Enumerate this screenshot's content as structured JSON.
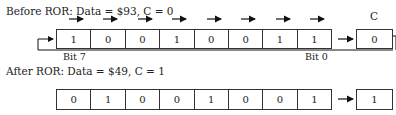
{
  "before": {
    "label": "Before ROR: Data = $93, C = 0",
    "bits": [
      "1",
      "0",
      "0",
      "1",
      "0",
      "0",
      "1",
      "1"
    ],
    "carry": "0"
  },
  "after": {
    "label": "After ROR: Data = $49, C = 1",
    "bits": [
      "0",
      "1",
      "0",
      "0",
      "1",
      "0",
      "0",
      "1"
    ],
    "carry": "1"
  },
  "labels": {
    "carry": "C",
    "bit7": "Bit 7",
    "bit0": "Bit 0"
  }
}
